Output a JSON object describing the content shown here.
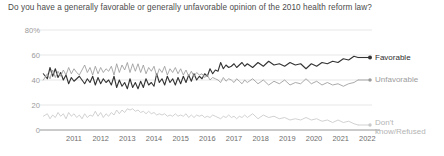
{
  "chart": {
    "title": "Do you have a generally favorable or generally unfavorable opinion of the 2010 health reform law?"
  },
  "legend": {
    "favorable": "Favorable",
    "unfavorable": "Unfavorable",
    "dontknow_line1": "Don't",
    "dontknow_line2": "know/Refused"
  },
  "colors": {
    "favorable": "#333333",
    "unfavorable": "#9b9b9b",
    "dontknow": "#c9c9c9",
    "grid": "#dcdcdc",
    "axis": "#8a8a8a",
    "title_text": "#4b4b4b"
  },
  "chart_data": {
    "type": "line",
    "title": "Do you have a generally favorable or generally unfavorable opinion of the 2010 health reform law?",
    "xlabel": "",
    "ylabel": "",
    "ylim": [
      0,
      80
    ],
    "yticks": [
      "0",
      "20",
      "40",
      "60",
      "80%"
    ],
    "ytick_values": [
      0,
      20,
      40,
      60,
      80
    ],
    "grid": true,
    "legend_position": "right",
    "x_axis_type": "year",
    "xlim": [
      2010.3,
      2022.3
    ],
    "categories": [
      "2011",
      "2012",
      "2013",
      "2014",
      "2015",
      "2016",
      "2017",
      "2018",
      "2019",
      "2020",
      "2021",
      "2022"
    ],
    "series": [
      {
        "name": "Favorable",
        "color": "#333333",
        "x": [
          2010.35,
          2010.5,
          2010.6,
          2010.7,
          2010.8,
          2010.9,
          2011.0,
          2011.1,
          2011.2,
          2011.3,
          2011.4,
          2011.5,
          2011.6,
          2011.7,
          2011.8,
          2011.9,
          2012.0,
          2012.1,
          2012.2,
          2012.3,
          2012.4,
          2012.5,
          2012.6,
          2012.7,
          2012.8,
          2012.9,
          2013.0,
          2013.1,
          2013.2,
          2013.3,
          2013.4,
          2013.5,
          2013.6,
          2013.7,
          2013.8,
          2013.9,
          2014.0,
          2014.1,
          2014.2,
          2014.3,
          2014.4,
          2014.5,
          2014.6,
          2014.7,
          2014.8,
          2014.9,
          2015.0,
          2015.1,
          2015.2,
          2015.3,
          2015.4,
          2015.5,
          2015.6,
          2015.7,
          2015.8,
          2015.9,
          2016.0,
          2016.1,
          2016.2,
          2016.3,
          2016.4,
          2016.5,
          2016.6,
          2016.7,
          2016.8,
          2016.9,
          2017.0,
          2017.1,
          2017.2,
          2017.3,
          2017.4,
          2017.5,
          2017.6,
          2017.7,
          2017.8,
          2017.9,
          2018.0,
          2018.2,
          2018.4,
          2018.6,
          2018.8,
          2019.0,
          2019.2,
          2019.4,
          2019.6,
          2019.8,
          2020.0,
          2020.2,
          2020.4,
          2020.6,
          2020.8,
          2021.0,
          2021.2,
          2021.4,
          2021.6,
          2021.8,
          2022.0,
          2022.15
        ],
        "values": [
          45,
          41,
          50,
          43,
          49,
          42,
          46,
          40,
          44,
          37,
          42,
          39,
          41,
          43,
          40,
          37,
          41,
          38,
          43,
          36,
          42,
          37,
          41,
          38,
          40,
          36,
          43,
          34,
          40,
          35,
          38,
          33,
          41,
          34,
          38,
          33,
          39,
          34,
          41,
          36,
          38,
          35,
          45,
          38,
          41,
          36,
          43,
          38,
          41,
          36,
          42,
          37,
          43,
          38,
          44,
          39,
          45,
          40,
          43,
          41,
          45,
          43,
          49,
          45,
          48,
          47,
          54,
          49,
          52,
          50,
          51,
          53,
          50,
          52,
          54,
          51,
          53,
          50,
          54,
          51,
          55,
          52,
          53,
          51,
          54,
          52,
          53,
          49,
          53,
          51,
          54,
          53,
          55,
          54,
          57,
          56,
          59,
          58
        ]
      },
      {
        "name": "Unfavorable",
        "color": "#9b9b9b",
        "x": [
          2010.35,
          2010.5,
          2010.6,
          2010.7,
          2010.8,
          2010.9,
          2011.0,
          2011.1,
          2011.2,
          2011.3,
          2011.4,
          2011.5,
          2011.6,
          2011.7,
          2011.8,
          2011.9,
          2012.0,
          2012.1,
          2012.2,
          2012.3,
          2012.4,
          2012.5,
          2012.6,
          2012.7,
          2012.8,
          2012.9,
          2013.0,
          2013.1,
          2013.2,
          2013.3,
          2013.4,
          2013.5,
          2013.6,
          2013.7,
          2013.8,
          2013.9,
          2014.0,
          2014.1,
          2014.2,
          2014.3,
          2014.4,
          2014.5,
          2014.6,
          2014.7,
          2014.8,
          2014.9,
          2015.0,
          2015.1,
          2015.2,
          2015.3,
          2015.4,
          2015.5,
          2015.6,
          2015.7,
          2015.8,
          2015.9,
          2016.0,
          2016.1,
          2016.2,
          2016.3,
          2016.4,
          2016.5,
          2016.6,
          2016.7,
          2016.8,
          2016.9,
          2017.0,
          2017.1,
          2017.2,
          2017.3,
          2017.4,
          2017.5,
          2017.6,
          2017.7,
          2017.8,
          2017.9,
          2018.0,
          2018.2,
          2018.4,
          2018.6,
          2018.8,
          2019.0,
          2019.2,
          2019.4,
          2019.6,
          2019.8,
          2020.0,
          2020.2,
          2020.4,
          2020.6,
          2020.8,
          2021.0,
          2021.2,
          2021.4,
          2021.6,
          2021.8,
          2022.0,
          2022.15
        ],
        "values": [
          40,
          45,
          41,
          48,
          42,
          47,
          43,
          48,
          44,
          50,
          45,
          49,
          46,
          44,
          48,
          52,
          46,
          50,
          44,
          51,
          45,
          50,
          46,
          49,
          47,
          51,
          44,
          53,
          46,
          52,
          48,
          54,
          46,
          53,
          47,
          53,
          46,
          52,
          45,
          50,
          47,
          51,
          43,
          49,
          46,
          51,
          44,
          49,
          46,
          50,
          45,
          49,
          44,
          48,
          43,
          47,
          43,
          46,
          44,
          45,
          42,
          44,
          40,
          42,
          41,
          40,
          38,
          42,
          39,
          41,
          40,
          38,
          41,
          39,
          37,
          40,
          38,
          41,
          37,
          40,
          36,
          39,
          37,
          40,
          36,
          38,
          37,
          41,
          37,
          39,
          36,
          38,
          36,
          37,
          35,
          37,
          38,
          40
        ]
      },
      {
        "name": "Don't know/Refused",
        "color": "#c9c9c9",
        "x": [
          2010.35,
          2010.5,
          2010.6,
          2010.7,
          2010.8,
          2010.9,
          2011.0,
          2011.1,
          2011.2,
          2011.3,
          2011.4,
          2011.5,
          2011.6,
          2011.7,
          2011.8,
          2011.9,
          2012.0,
          2012.1,
          2012.2,
          2012.3,
          2012.4,
          2012.5,
          2012.6,
          2012.7,
          2012.8,
          2012.9,
          2013.0,
          2013.1,
          2013.2,
          2013.3,
          2013.4,
          2013.5,
          2013.6,
          2013.7,
          2013.8,
          2013.9,
          2014.0,
          2014.1,
          2014.2,
          2014.3,
          2014.4,
          2014.5,
          2014.6,
          2014.7,
          2014.8,
          2014.9,
          2015.0,
          2015.1,
          2015.2,
          2015.3,
          2015.4,
          2015.5,
          2015.6,
          2015.7,
          2015.8,
          2015.9,
          2016.0,
          2016.1,
          2016.2,
          2016.3,
          2016.4,
          2016.5,
          2016.6,
          2016.7,
          2016.8,
          2016.9,
          2017.0,
          2017.1,
          2017.2,
          2017.3,
          2017.4,
          2017.5,
          2017.6,
          2017.7,
          2017.8,
          2017.9,
          2018.0,
          2018.2,
          2018.4,
          2018.6,
          2018.8,
          2019.0,
          2019.2,
          2019.4,
          2019.6,
          2019.8,
          2020.0,
          2020.2,
          2020.4,
          2020.6,
          2020.8,
          2021.0,
          2021.2,
          2021.4,
          2021.6,
          2021.8,
          2022.0,
          2022.15
        ],
        "values": [
          11,
          13,
          9,
          12,
          10,
          14,
          11,
          13,
          9,
          14,
          11,
          13,
          10,
          12,
          9,
          13,
          10,
          12,
          11,
          15,
          11,
          14,
          10,
          13,
          11,
          14,
          12,
          16,
          13,
          16,
          14,
          17,
          16,
          17,
          15,
          16,
          14,
          15,
          13,
          15,
          13,
          14,
          12,
          13,
          12,
          13,
          11,
          12,
          11,
          13,
          11,
          12,
          11,
          13,
          10,
          12,
          10,
          12,
          11,
          12,
          10,
          11,
          10,
          12,
          11,
          10,
          9,
          11,
          10,
          12,
          10,
          11,
          9,
          11,
          10,
          12,
          10,
          13,
          9,
          12,
          10,
          11,
          9,
          10,
          8,
          9,
          8,
          10,
          8,
          9,
          7,
          8,
          6,
          8,
          6,
          7,
          5,
          4
        ]
      }
    ]
  }
}
